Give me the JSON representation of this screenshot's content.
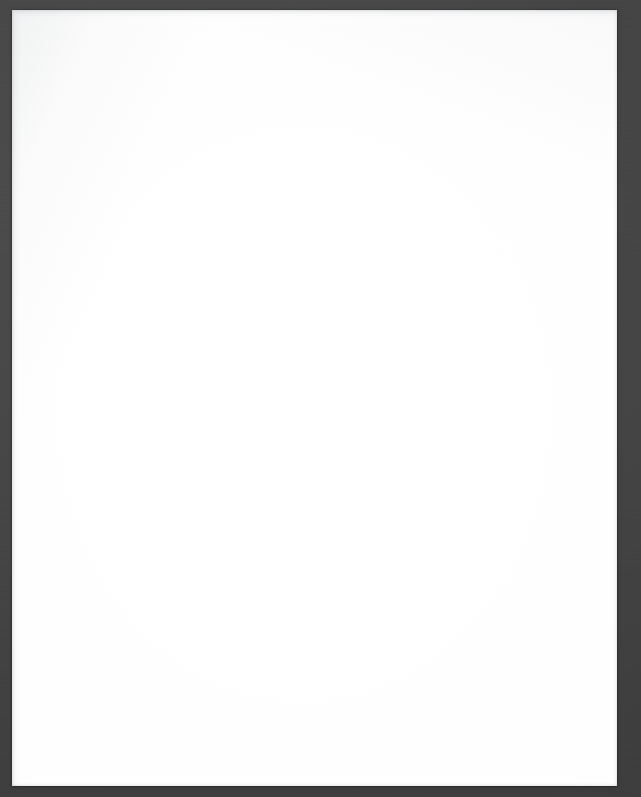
{
  "scan": {
    "subject": "blank grid paper sheet",
    "caption": "Scanned blank graph paper sheet on dark background",
    "background_color": "#434343",
    "image_width": 641,
    "image_height": 797
  },
  "paper": {
    "name": "grid-paper-sheet",
    "paper_color": "#fdfdfd",
    "grid_line_color": "#969eaa",
    "faint_line_color": "#bac0ca",
    "cell_size_px": 29.5,
    "columns": 20,
    "rows": 26,
    "left_px": 12,
    "top_px": 10,
    "width_px": 605,
    "height_px": 776,
    "content_text": ""
  }
}
